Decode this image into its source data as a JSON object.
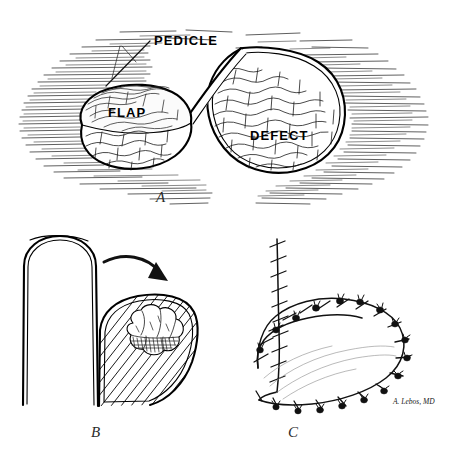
{
  "figure": {
    "background_color": "#ffffff",
    "ink_color": "#111111",
    "panels": [
      {
        "id": "A",
        "letter": "A",
        "caption": "Flap elevated on pedicle adjacent to defect",
        "labels": [
          {
            "name": "flap",
            "text": "FLAP"
          },
          {
            "name": "pedicle",
            "text": "PEDICLE"
          },
          {
            "name": "defect",
            "text": "DEFECT"
          }
        ]
      },
      {
        "id": "B",
        "letter": "B",
        "caption": "Flap rotated into hatched defect containing tissue mass"
      },
      {
        "id": "C",
        "letter": "C",
        "caption": "Closed wound with interrupted sutures",
        "signature": "A. Lebos, MD"
      }
    ]
  },
  "panel_a": {
    "label_flap": "FLAP",
    "label_pedicle": "PEDICLE",
    "label_defect": "DEFECT",
    "letter": "A"
  },
  "panel_b": {
    "letter": "B"
  },
  "panel_c": {
    "letter": "C",
    "signature": "A. Lebos, MD"
  }
}
